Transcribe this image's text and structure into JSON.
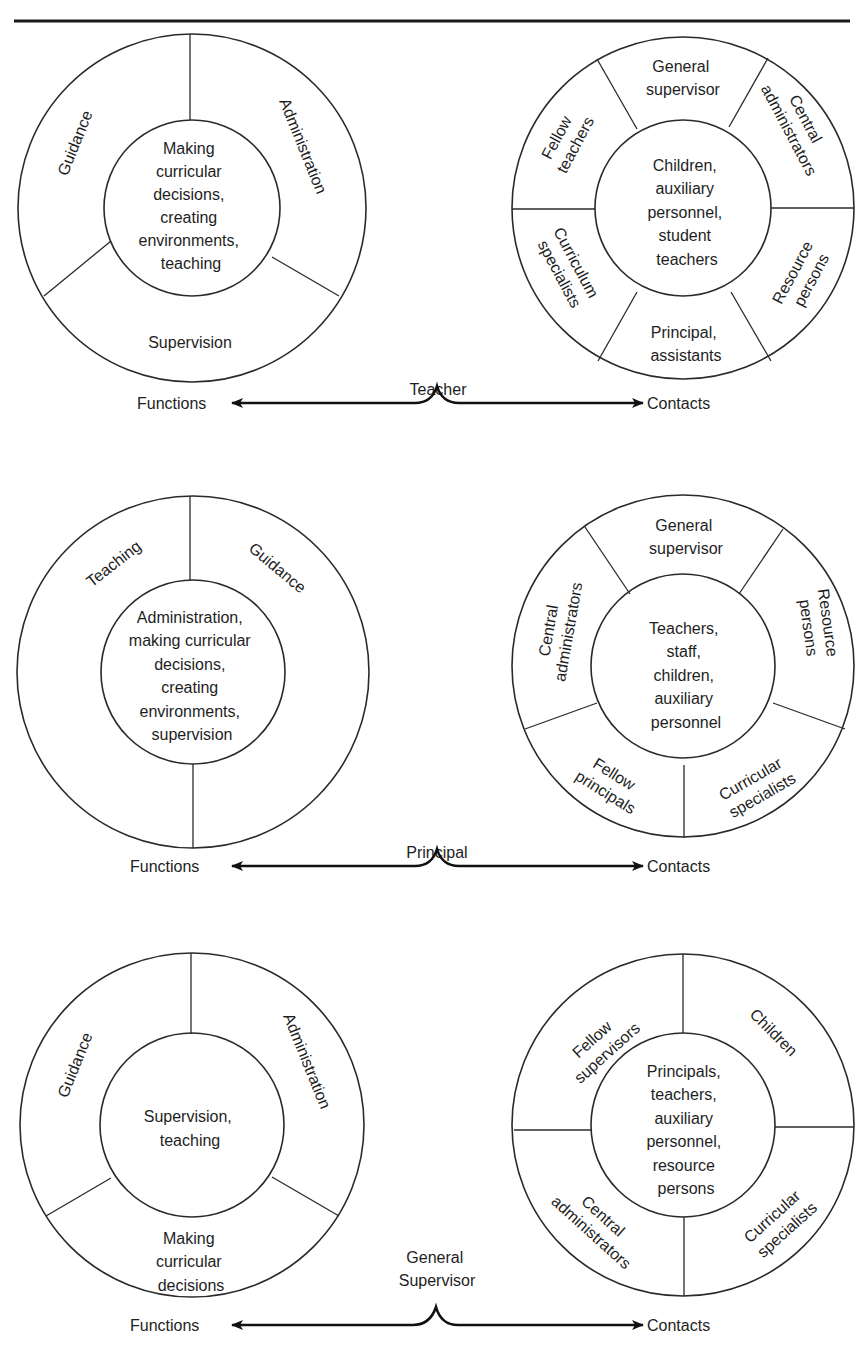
{
  "diagrams": [
    {
      "role": "Teacher",
      "functions": {
        "center": [
          "Making",
          "curricular",
          "decisions,",
          "creating",
          "environments,",
          "teaching"
        ],
        "segments": [
          "Guidance",
          "Administration",
          "Supervision"
        ]
      },
      "contacts": {
        "center": [
          "Children,",
          "auxiliary",
          "personnel,",
          "student",
          "teachers"
        ],
        "segments": [
          [
            "General",
            "supervisor"
          ],
          [
            "Central",
            "administrators"
          ],
          [
            "Resource",
            "persons"
          ],
          [
            "Principal,",
            "assistants"
          ],
          [
            "Curriculum",
            "specialists"
          ],
          [
            "Fellow",
            "teachers"
          ]
        ]
      },
      "functions_label": "Functions",
      "contacts_label": "Contacts"
    },
    {
      "role": "Principal",
      "functions": {
        "center": [
          "Administration,",
          "making curricular",
          "decisions,",
          "creating",
          "environments,",
          "supervision"
        ],
        "segments": [
          "Teaching",
          "Guidance"
        ]
      },
      "contacts": {
        "center": [
          "Teachers,",
          "staff,",
          "children,",
          "auxiliary",
          "personnel"
        ],
        "segments": [
          [
            "General",
            "supervisor"
          ],
          [
            "Resource",
            "persons"
          ],
          [
            "Curricular",
            "specialists"
          ],
          [
            "Fellow",
            "principals"
          ],
          [
            "Central",
            "administrators"
          ]
        ]
      },
      "functions_label": "Functions",
      "contacts_label": "Contacts"
    },
    {
      "role": [
        "General",
        "Supervisor"
      ],
      "functions": {
        "center": [
          "Supervision,",
          "teaching"
        ],
        "segments": [
          "Guidance",
          "Administration",
          [
            "Making",
            "curricular",
            "decisions"
          ]
        ]
      },
      "contacts": {
        "center": [
          "Principals,",
          "teachers,",
          "auxiliary",
          "personnel,",
          "resource",
          "persons"
        ],
        "segments": [
          [
            "Fellow",
            "supervisors"
          ],
          [
            "Children"
          ],
          [
            "Curricular",
            "specialists"
          ],
          [
            "Central",
            "administrators"
          ]
        ]
      },
      "functions_label": "Functions",
      "contacts_label": "Contacts"
    }
  ]
}
